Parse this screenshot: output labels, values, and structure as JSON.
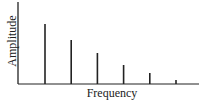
{
  "chart_data": {
    "type": "bar",
    "title": "",
    "xlabel": "Frequency",
    "ylabel": "Amplitude",
    "categories": [
      "f1",
      "f2",
      "f3",
      "f4",
      "f5",
      "f6"
    ],
    "values": [
      60,
      44,
      31,
      19,
      11,
      4
    ],
    "ylim": [
      0,
      82
    ],
    "grid": false,
    "legend": null,
    "tick_labels_visible": false,
    "style": "stem spectrum (vertical lines)",
    "colors": {
      "bars": "#222222",
      "axes": "#222222",
      "background": "#ffffff"
    }
  }
}
